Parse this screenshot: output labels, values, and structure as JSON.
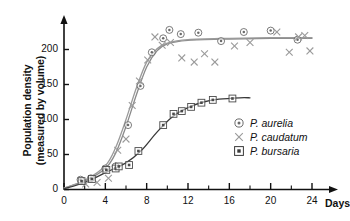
{
  "chart_data": {
    "type": "scatter",
    "title": "",
    "xlabel": "Days",
    "ylabel_line1": "Population density",
    "ylabel_line2": "(measured by volume)",
    "xlim": [
      0,
      24
    ],
    "ylim": [
      0,
      230
    ],
    "grid": false,
    "legend_position": "inside-right",
    "xticks_major": [
      0,
      4,
      8,
      12,
      16,
      20,
      24
    ],
    "xticks_minor": [
      2,
      6,
      10,
      14,
      18,
      22
    ],
    "xtick_labels": [
      "0",
      "4",
      "8",
      "12",
      "16",
      "20",
      "24"
    ],
    "yticks": [
      0,
      50,
      100,
      150,
      200
    ],
    "ytick_labels": [
      "0",
      "50",
      "100",
      "150",
      "200"
    ],
    "series": [
      {
        "name": "P. aurelia",
        "marker": "circle-dot",
        "color": "#6b6b6b",
        "line_color": "#8a8a8a",
        "points": [
          {
            "x": 1.6,
            "y": 14
          },
          {
            "x": 2.6,
            "y": 16
          },
          {
            "x": 4.0,
            "y": 30
          },
          {
            "x": 5.0,
            "y": 33
          },
          {
            "x": 6.2,
            "y": 92
          },
          {
            "x": 7.4,
            "y": 148
          },
          {
            "x": 8.5,
            "y": 196
          },
          {
            "x": 9.6,
            "y": 216
          },
          {
            "x": 10.2,
            "y": 228
          },
          {
            "x": 11.3,
            "y": 222
          },
          {
            "x": 13.0,
            "y": 224
          },
          {
            "x": 15.2,
            "y": 212
          },
          {
            "x": 17.4,
            "y": 225
          },
          {
            "x": 20.0,
            "y": 227
          },
          {
            "x": 22.6,
            "y": 214
          }
        ],
        "curve": [
          {
            "x": 0.0,
            "y": 2
          },
          {
            "x": 2.0,
            "y": 12
          },
          {
            "x": 4.0,
            "y": 30
          },
          {
            "x": 5.0,
            "y": 52
          },
          {
            "x": 6.0,
            "y": 90
          },
          {
            "x": 7.0,
            "y": 135
          },
          {
            "x": 8.0,
            "y": 175
          },
          {
            "x": 9.0,
            "y": 198
          },
          {
            "x": 10.0,
            "y": 208
          },
          {
            "x": 12.0,
            "y": 213
          },
          {
            "x": 16.0,
            "y": 215
          },
          {
            "x": 20.0,
            "y": 216
          },
          {
            "x": 24.0,
            "y": 216
          }
        ]
      },
      {
        "name": "P. caudatum",
        "marker": "cross",
        "color": "#9a9a9a",
        "line_color": "#9a9a9a",
        "points": [
          {
            "x": 2.1,
            "y": 8
          },
          {
            "x": 3.2,
            "y": 10
          },
          {
            "x": 4.3,
            "y": 16
          },
          {
            "x": 5.2,
            "y": 56
          },
          {
            "x": 6.0,
            "y": 72
          },
          {
            "x": 6.6,
            "y": 120
          },
          {
            "x": 7.3,
            "y": 155
          },
          {
            "x": 8.1,
            "y": 185
          },
          {
            "x": 8.8,
            "y": 218
          },
          {
            "x": 9.5,
            "y": 206
          },
          {
            "x": 10.3,
            "y": 210
          },
          {
            "x": 11.4,
            "y": 188
          },
          {
            "x": 12.6,
            "y": 182
          },
          {
            "x": 13.6,
            "y": 194
          },
          {
            "x": 14.6,
            "y": 182
          },
          {
            "x": 16.5,
            "y": 205
          },
          {
            "x": 18.0,
            "y": 210
          },
          {
            "x": 20.6,
            "y": 225
          },
          {
            "x": 21.8,
            "y": 196
          },
          {
            "x": 22.7,
            "y": 218
          },
          {
            "x": 23.3,
            "y": 220
          },
          {
            "x": 23.8,
            "y": 198
          }
        ],
        "curve": [
          {
            "x": 0.0,
            "y": 2
          },
          {
            "x": 2.0,
            "y": 13
          },
          {
            "x": 4.0,
            "y": 34
          },
          {
            "x": 5.0,
            "y": 60
          },
          {
            "x": 6.0,
            "y": 100
          },
          {
            "x": 7.0,
            "y": 145
          },
          {
            "x": 8.0,
            "y": 182
          },
          {
            "x": 9.0,
            "y": 201
          },
          {
            "x": 10.0,
            "y": 209
          },
          {
            "x": 12.0,
            "y": 214
          },
          {
            "x": 16.0,
            "y": 216
          },
          {
            "x": 20.0,
            "y": 217
          },
          {
            "x": 24.0,
            "y": 217
          }
        ]
      },
      {
        "name": "P. bursaria",
        "marker": "square-dot",
        "color": "#4a4a4a",
        "line_color": "#3a3a3a",
        "points": [
          {
            "x": 1.7,
            "y": 12
          },
          {
            "x": 2.7,
            "y": 15
          },
          {
            "x": 4.1,
            "y": 28
          },
          {
            "x": 5.0,
            "y": 30
          },
          {
            "x": 5.3,
            "y": 33
          },
          {
            "x": 6.3,
            "y": 35
          },
          {
            "x": 7.2,
            "y": 55
          },
          {
            "x": 9.6,
            "y": 92
          },
          {
            "x": 10.6,
            "y": 108
          },
          {
            "x": 11.4,
            "y": 112
          },
          {
            "x": 12.3,
            "y": 118
          },
          {
            "x": 13.3,
            "y": 124
          },
          {
            "x": 14.4,
            "y": 128
          },
          {
            "x": 16.3,
            "y": 130
          }
        ],
        "curve": [
          {
            "x": 0.0,
            "y": 1
          },
          {
            "x": 2.0,
            "y": 10
          },
          {
            "x": 4.0,
            "y": 24
          },
          {
            "x": 6.0,
            "y": 38
          },
          {
            "x": 7.5,
            "y": 56
          },
          {
            "x": 9.0,
            "y": 82
          },
          {
            "x": 10.5,
            "y": 104
          },
          {
            "x": 12.0,
            "y": 117
          },
          {
            "x": 13.5,
            "y": 125
          },
          {
            "x": 15.0,
            "y": 129
          },
          {
            "x": 17.0,
            "y": 131
          },
          {
            "x": 18.0,
            "y": 131
          }
        ]
      }
    ]
  },
  "axes": {
    "x_axis_name": "Days",
    "y_axis_title_line1": "Population density",
    "y_axis_title_line2": "(measured by volume)"
  },
  "legend": {
    "entries": [
      {
        "label": "P. aurelia",
        "marker": "circle-dot"
      },
      {
        "label": "P. caudatum",
        "marker": "cross"
      },
      {
        "label": "P. bursaria",
        "marker": "square-dot"
      }
    ]
  },
  "colors": {
    "axis": "#111111",
    "aurelia": "#6b6b6b",
    "caudatum": "#9a9a9a",
    "bursaria": "#3a3a3a",
    "background": "#ffffff"
  }
}
